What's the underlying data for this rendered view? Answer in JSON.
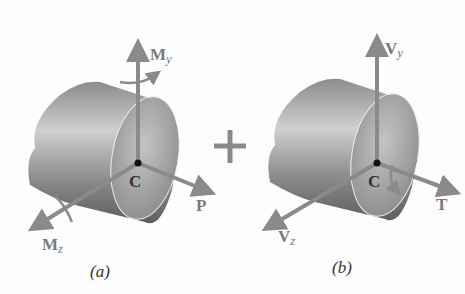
{
  "figure": {
    "panels": [
      {
        "id": "a",
        "caption": "(a)",
        "point_label": "C",
        "vectors": [
          {
            "name": "M",
            "sub": "y",
            "direction": "up",
            "type": "moment"
          },
          {
            "name": "P",
            "sub": "",
            "direction": "x-axis",
            "type": "force"
          },
          {
            "name": "M",
            "sub": "z",
            "direction": "z-axis",
            "type": "moment"
          }
        ]
      },
      {
        "id": "b",
        "caption": "(b)",
        "point_label": "C",
        "vectors": [
          {
            "name": "V",
            "sub": "y",
            "direction": "up",
            "type": "force"
          },
          {
            "name": "T",
            "sub": "",
            "direction": "x-axis",
            "type": "torque"
          },
          {
            "name": "V",
            "sub": "z",
            "direction": "z-axis",
            "type": "force"
          }
        ]
      }
    ],
    "operator": "+",
    "colors": {
      "arrow": "#8a8a8a",
      "cylinder_dark": "#6e6e6e",
      "cylinder_light": "#c9c9c9",
      "face": "#a9a9a9",
      "text": "#333333"
    }
  }
}
